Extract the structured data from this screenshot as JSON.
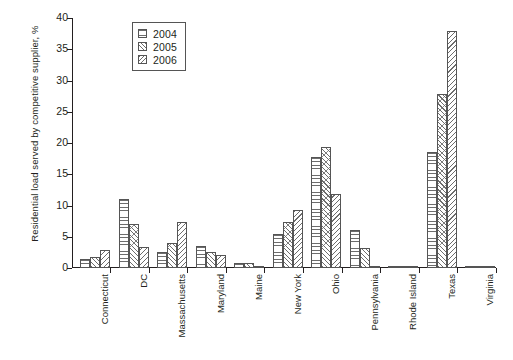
{
  "chart_data": {
    "type": "bar",
    "title": "",
    "xlabel": "",
    "ylabel": "Residential load served by competitive supplier, %",
    "ylim": [
      0,
      40
    ],
    "yticks": [
      0,
      5,
      10,
      15,
      20,
      25,
      30,
      35,
      40
    ],
    "grid": false,
    "legend_position": "top-left-inside",
    "categories": [
      "Connecticut",
      "DC",
      "Massachusetts",
      "Maryland",
      "Maine",
      "New York",
      "Ohio",
      "Pennsylvania",
      "Rhode Island",
      "Texas",
      "Virginia"
    ],
    "series": [
      {
        "name": "2004",
        "pattern": "horizontal-lines",
        "values": [
          1.5,
          11.0,
          2.6,
          3.5,
          0.8,
          5.5,
          17.8,
          6.1,
          0.2,
          18.5,
          0.2
        ]
      },
      {
        "name": "2005",
        "pattern": "cross-diagonal-hatch",
        "values": [
          1.7,
          7.0,
          4.0,
          2.6,
          0.8,
          7.3,
          19.3,
          3.2,
          0.2,
          27.9,
          0.2
        ]
      },
      {
        "name": "2006",
        "pattern": "diagonal-hatch",
        "values": [
          2.9,
          3.3,
          7.3,
          2.1,
          0.3,
          9.3,
          11.8,
          0.1,
          0.2,
          38.0,
          0.2
        ]
      }
    ]
  },
  "legend": {
    "entries": [
      {
        "label": "2004",
        "swatch": "swatch-horizontal-lines"
      },
      {
        "label": "2005",
        "swatch": "swatch-cross-diagonal-hatch"
      },
      {
        "label": "2006",
        "swatch": "swatch-diagonal-hatch"
      }
    ]
  },
  "colors": {
    "axis": "#231f20",
    "hatch": "#6d6d6d",
    "background": "#ffffff"
  }
}
